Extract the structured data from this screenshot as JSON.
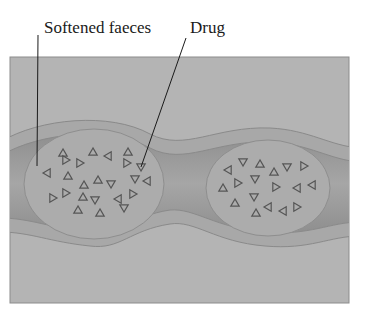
{
  "figure": {
    "labels": [
      {
        "id": "softened-faeces",
        "text": "Softened faeces",
        "x": 44,
        "y": 33,
        "leader": {
          "x1": 38,
          "y1": 35,
          "x2": 37,
          "y2": 166
        }
      },
      {
        "id": "drug",
        "text": "Drug",
        "x": 190,
        "y": 33,
        "leader": {
          "x1": 186,
          "y1": 38,
          "x2": 141,
          "y2": 167
        }
      }
    ],
    "colors": {
      "background": "#b4b4b4",
      "border": "#8c8c8c",
      "wall": "#a9a9a9",
      "wall_edge": "#8a8a8a",
      "lumen": "#9a9a9a",
      "faeces": "#ababab",
      "triangle_stroke": "#555555",
      "label_text": "#1a1a1a"
    },
    "lumps": [
      {
        "id": "left-faeces-mass",
        "cx": 94,
        "cy": 184,
        "rx": 70,
        "ry": 55
      },
      {
        "id": "right-faeces-mass",
        "cx": 268,
        "cy": 188,
        "rx": 62,
        "ry": 48
      }
    ],
    "drug_particles": {
      "left": [
        [
          63,
          153,
          "up"
        ],
        [
          66,
          160,
          "right"
        ],
        [
          80,
          163,
          "right"
        ],
        [
          93,
          152,
          "up"
        ],
        [
          108,
          156,
          "left"
        ],
        [
          128,
          152,
          "up"
        ],
        [
          127,
          163,
          "right"
        ],
        [
          141,
          167,
          "down"
        ],
        [
          47,
          173,
          "left"
        ],
        [
          68,
          176,
          "up"
        ],
        [
          98,
          180,
          "up"
        ],
        [
          84,
          185,
          "up"
        ],
        [
          111,
          184,
          "down"
        ],
        [
          135,
          179,
          "down"
        ],
        [
          147,
          181,
          "left"
        ],
        [
          53,
          198,
          "right"
        ],
        [
          66,
          193,
          "right"
        ],
        [
          83,
          197,
          "up"
        ],
        [
          95,
          200,
          "down"
        ],
        [
          118,
          199,
          "left"
        ],
        [
          133,
          194,
          "right"
        ],
        [
          100,
          213,
          "up"
        ],
        [
          124,
          208,
          "down"
        ],
        [
          78,
          210,
          "up"
        ]
      ],
      "right": [
        [
          228,
          170,
          "left"
        ],
        [
          243,
          162,
          "down"
        ],
        [
          260,
          164,
          "up"
        ],
        [
          274,
          172,
          "up"
        ],
        [
          287,
          167,
          "down"
        ],
        [
          304,
          166,
          "right"
        ],
        [
          223,
          188,
          "up"
        ],
        [
          238,
          183,
          "right"
        ],
        [
          255,
          179,
          "down"
        ],
        [
          276,
          187,
          "right"
        ],
        [
          297,
          188,
          "left"
        ],
        [
          312,
          185,
          "left"
        ],
        [
          235,
          203,
          "up"
        ],
        [
          254,
          197,
          "down"
        ],
        [
          268,
          207,
          "left"
        ],
        [
          283,
          211,
          "left"
        ],
        [
          297,
          207,
          "right"
        ],
        [
          256,
          213,
          "up"
        ]
      ]
    }
  }
}
